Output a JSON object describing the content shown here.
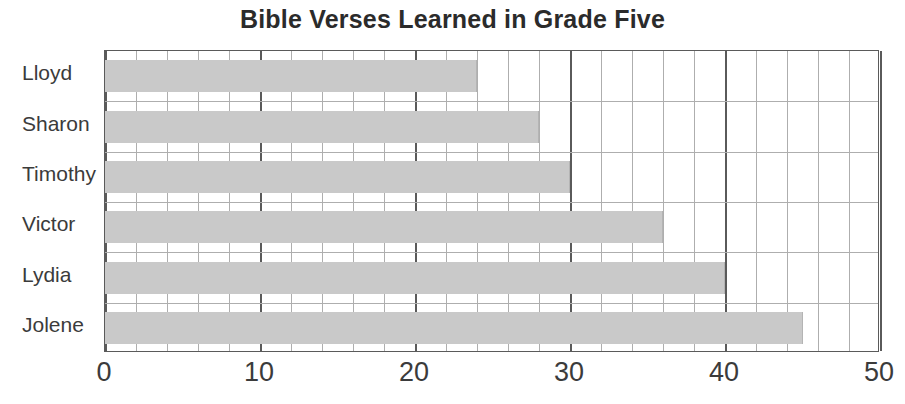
{
  "chart_data": {
    "type": "bar",
    "orientation": "horizontal",
    "title": "Bible Verses Learned in Grade Five",
    "xlabel": "",
    "ylabel": "",
    "categories": [
      "Lloyd",
      "Sharon",
      "Timothy",
      "Victor",
      "Lydia",
      "Jolene"
    ],
    "values": [
      24,
      28,
      30,
      36,
      40,
      45
    ],
    "xlim": [
      0,
      50
    ],
    "xticks": [
      0,
      10,
      20,
      30,
      40,
      50
    ],
    "xtick_labels": [
      "0",
      "10",
      "20",
      "30",
      "40",
      "50"
    ],
    "minor_tick_step": 2,
    "grid": true,
    "legend": false,
    "bar_color": "#c9c9c9",
    "axis_color": "#5a5a5a",
    "gridline_color": "#aeaeae",
    "title_color": "#2b2b2b",
    "label_color": "#3b3b3b"
  }
}
